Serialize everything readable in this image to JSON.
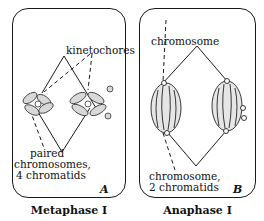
{
  "figure": {
    "panels": [
      {
        "id": "A",
        "letter": "A",
        "caption": "Metaphase I",
        "labels": {
          "kinetochores": "kinetochores",
          "paired_line1": "paired",
          "paired_line2": "chromosomes,",
          "paired_line3": "4 chromatids"
        }
      },
      {
        "id": "B",
        "letter": "B",
        "caption": "Anaphase I",
        "labels": {
          "chromosome": "chromosome",
          "chromatids_line1": "chromosome,",
          "chromatids_line2": "2 chromatids"
        }
      }
    ],
    "colors": {
      "ink": "#1a1a1a",
      "background": "#ffffff"
    }
  }
}
